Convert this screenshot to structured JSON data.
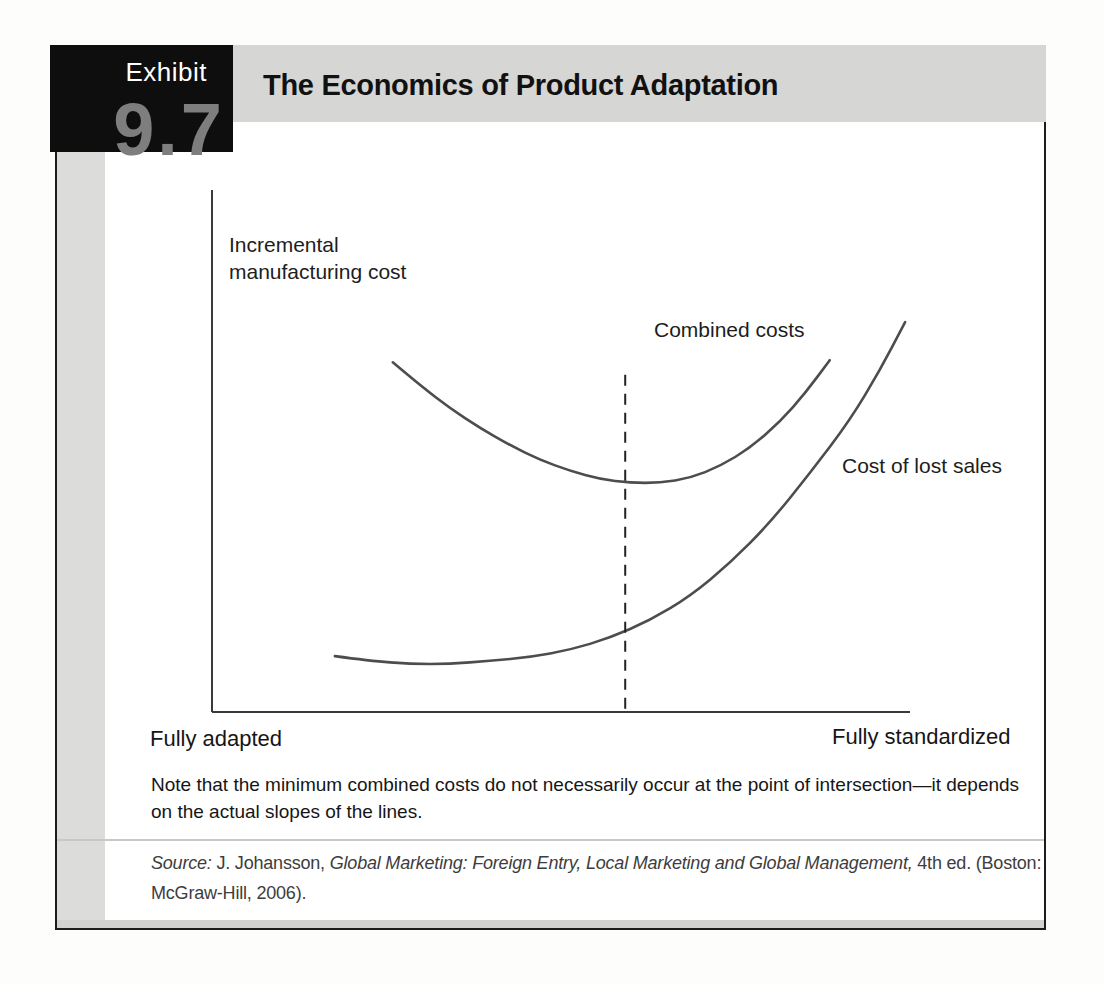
{
  "exhibit": {
    "label": "Exhibit",
    "number": "9.7",
    "title": "The Economics of Product Adaptation"
  },
  "chart": {
    "y_axis_label_line1": "Incremental",
    "y_axis_label_line2": "manufacturing cost",
    "combined_label": "Combined costs",
    "lost_sales_label": "Cost of lost sales",
    "x_left_label": "Fully adapted",
    "x_right_label": "Fully standardized"
  },
  "note": {
    "line1": "Note that the minimum combined costs do not necessarily occur at the point of intersection—it depends",
    "line2": "on the actual slopes of the lines."
  },
  "source": {
    "prefix": "Source:",
    "author": " J. Johansson, ",
    "book_title": "Global Marketing: Foreign Entry, Local Marketing and Global Management,",
    "rest": " 4th ed. (Boston:",
    "line2": "McGraw-Hill, 2006)."
  },
  "colors": {
    "curve": "#4d4d4d",
    "axis": "#3a3a3a",
    "dashed_line": "#222222",
    "title_bar_bg": "#d6d6d4",
    "left_strip_bg": "#dcdcda",
    "exhibit_box_bg": "#0e0e0e",
    "exhibit_number": "#7e7e7e"
  },
  "chart_data": {
    "type": "line",
    "title": "The Economics of Product Adaptation",
    "ylabel": "Incremental manufacturing cost",
    "x_axis_left_end_label": "Fully adapted",
    "x_axis_right_end_label": "Fully standardized",
    "x_axis_range": [
      0,
      1
    ],
    "y_axis_range": [
      0,
      1
    ],
    "grid": false,
    "legend_position": "inline-curve-labels",
    "series": [
      {
        "name": "Combined costs",
        "points": [
          [
            0.259,
            0.67
          ],
          [
            0.298,
            0.626
          ],
          [
            0.341,
            0.582
          ],
          [
            0.384,
            0.544
          ],
          [
            0.427,
            0.511
          ],
          [
            0.47,
            0.483
          ],
          [
            0.513,
            0.462
          ],
          [
            0.556,
            0.446
          ],
          [
            0.599,
            0.439
          ],
          [
            0.642,
            0.439
          ],
          [
            0.685,
            0.448
          ],
          [
            0.728,
            0.471
          ],
          [
            0.771,
            0.506
          ],
          [
            0.814,
            0.556
          ],
          [
            0.85,
            0.611
          ],
          [
            0.885,
            0.674
          ]
        ]
      },
      {
        "name": "Cost of lost sales",
        "points": [
          [
            0.176,
            0.107
          ],
          [
            0.226,
            0.098
          ],
          [
            0.284,
            0.092
          ],
          [
            0.341,
            0.092
          ],
          [
            0.398,
            0.098
          ],
          [
            0.456,
            0.105
          ],
          [
            0.513,
            0.119
          ],
          [
            0.57,
            0.142
          ],
          [
            0.628,
            0.176
          ],
          [
            0.685,
            0.222
          ],
          [
            0.742,
            0.285
          ],
          [
            0.799,
            0.362
          ],
          [
            0.857,
            0.458
          ],
          [
            0.914,
            0.559
          ],
          [
            0.957,
            0.655
          ],
          [
            0.993,
            0.747
          ]
        ]
      }
    ],
    "dashed_marker": {
      "x": 0.592,
      "y_top": 0.646
    }
  }
}
